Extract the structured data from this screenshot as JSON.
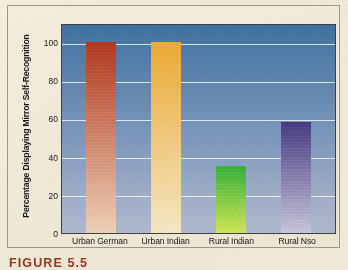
{
  "figure": {
    "caption": "FIGURE 5.5",
    "caption_color": "#9a3324",
    "frame_border_color": "#9a968c",
    "page_background": "#efe9d8"
  },
  "chart_data": {
    "type": "bar",
    "title": "",
    "xlabel": "",
    "ylabel": "Percentage Displaying Mirror Self-Recognition",
    "categories": [
      "Urban German",
      "Urban Indian",
      "Rural Indian",
      "Rural Nso"
    ],
    "values": [
      100,
      100,
      35,
      58
    ],
    "ylim": [
      0,
      110
    ],
    "yticks": [
      0,
      20,
      40,
      60,
      80,
      100
    ],
    "ytick_labels": [
      "0",
      "20",
      "40",
      "60",
      "80",
      "100"
    ],
    "grid": true,
    "grid_color": "#ffffff",
    "legend": null,
    "legend_position": "none",
    "plot_background_top": "#3f6e9e",
    "plot_background_bottom": "#aeb7cb",
    "axis_border_color": "#3f3f45",
    "bars": [
      {
        "category": "Urban German",
        "value": 100,
        "color_top": "#b0381f",
        "color_bottom": "#ecceb4"
      },
      {
        "category": "Urban Indian",
        "value": 100,
        "color_top": "#eaa832",
        "color_bottom": "#f3e6c2"
      },
      {
        "category": "Rural Indian",
        "value": 35,
        "color_top": "#36ae3a",
        "color_bottom": "#cde552"
      },
      {
        "category": "Rural Nso",
        "value": 58,
        "color_top": "#453a80",
        "color_bottom": "#c5c2d8"
      }
    ]
  }
}
